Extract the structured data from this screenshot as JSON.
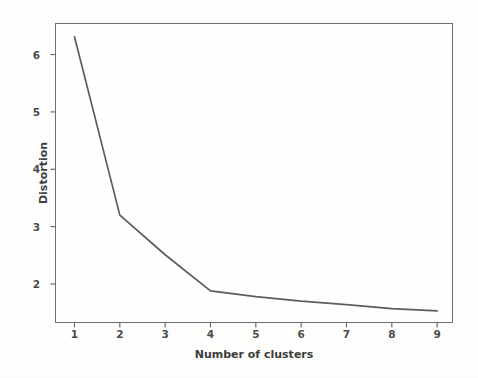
{
  "chart_data": {
    "type": "line",
    "title": "",
    "xlabel": "Number of clusters",
    "ylabel": "Distortion",
    "x": [
      1,
      2,
      3,
      4,
      5,
      6,
      7,
      8,
      9
    ],
    "values": [
      6.31,
      3.2,
      2.51,
      1.88,
      1.78,
      1.7,
      1.64,
      1.57,
      1.53
    ],
    "series": [
      {
        "name": "Distortion",
        "values": [
          6.31,
          3.2,
          2.51,
          1.88,
          1.78,
          1.7,
          1.64,
          1.57,
          1.53
        ]
      }
    ],
    "xticks": [
      "1",
      "2",
      "3",
      "4",
      "5",
      "6",
      "7",
      "8",
      "9"
    ],
    "yticks": [
      "2",
      "3",
      "4",
      "5",
      "6"
    ],
    "xlim": [
      0.57,
      9.35
    ],
    "ylim": [
      1.32,
      6.55
    ],
    "grid": false,
    "legend": null,
    "line_color": "#5d5d5d",
    "axis_color": "#6e6e6e",
    "background_color": "#ffffff",
    "figure_background": "#fefefd",
    "marker": "none",
    "linewidth": 1.6
  }
}
